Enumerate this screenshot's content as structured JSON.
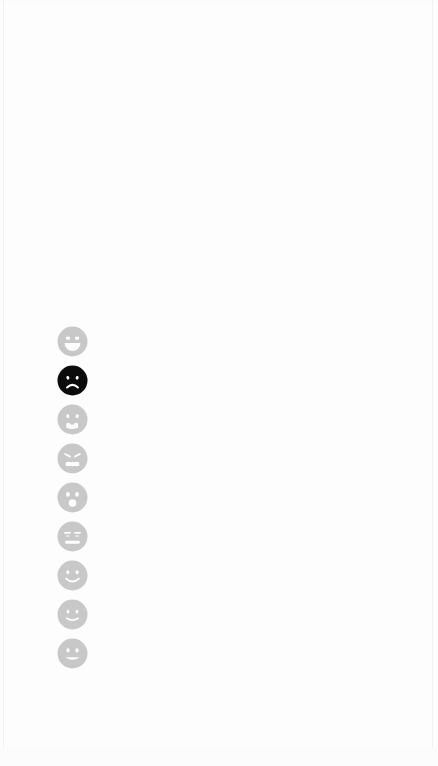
{
  "canvas": {
    "width": 438,
    "height": 766,
    "background_color": "#fdfdfd"
  },
  "rating_scale": {
    "name": "emoji-rating-scale",
    "orientation": "vertical",
    "option_count": 9,
    "selected_index": 1,
    "geometry": {
      "column_center_x": 72,
      "first_center_y": 341,
      "last_center_y": 655,
      "diameter_px": 31,
      "spacing_px": 39
    },
    "colors": {
      "unselected_fill": "#c8c8c8",
      "unselected_feature": "#fdfdfd",
      "selected_fill": "#0b0b0b",
      "selected_feature": "#ffffff"
    },
    "options": [
      {
        "index": 0,
        "icon": "grinning-face-with-open-mouth-icon",
        "label": "Grinning face with open mouth",
        "selected": false,
        "center_y": 341
      },
      {
        "index": 1,
        "icon": "sad-frowning-face-icon",
        "label": "Sad frowning face",
        "selected": true,
        "center_y": 379
      },
      {
        "index": 2,
        "icon": "distressed-crying-face-icon",
        "label": "Distressed crying face",
        "selected": false,
        "center_y": 418
      },
      {
        "index": 3,
        "icon": "confounded-face-icon",
        "label": "Confounded face",
        "selected": false,
        "center_y": 457
      },
      {
        "index": 4,
        "icon": "surprised-face-with-open-mouth-icon",
        "label": "Surprised face with open mouth",
        "selected": false,
        "center_y": 496
      },
      {
        "index": 5,
        "icon": "expressionless-flat-mouth-face-icon",
        "label": "Expressionless face with flat mouth",
        "selected": false,
        "center_y": 536
      },
      {
        "index": 6,
        "icon": "smiling-face-icon",
        "label": "Smiling face",
        "selected": false,
        "center_y": 575
      },
      {
        "index": 7,
        "icon": "slightly-smiling-face-icon",
        "label": "Slightly smiling face",
        "selected": false,
        "center_y": 615
      },
      {
        "index": 8,
        "icon": "smiling-face-with-smiling-eyes-icon",
        "label": "Smiling face with smiling eyes",
        "selected": false,
        "center_y": 655
      }
    ]
  }
}
